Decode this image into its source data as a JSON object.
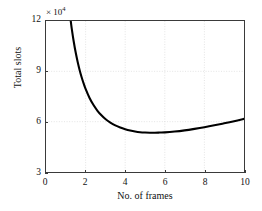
{
  "chart_data": {
    "type": "line",
    "title": "",
    "xlabel": "No. of frames",
    "ylabel": "Total slots",
    "y_multiplier_text": "× 10",
    "y_multiplier_exponent": "4",
    "xlim": [
      0,
      10
    ],
    "ylim": [
      3,
      12
    ],
    "xticks": [
      0,
      2,
      4,
      6,
      8,
      10
    ],
    "xtick_labels": [
      "0",
      "2",
      "4",
      "6",
      "8",
      "10"
    ],
    "yticks": [
      3,
      6,
      9,
      12
    ],
    "ytick_labels": [
      "3",
      "6",
      "9",
      "12"
    ],
    "grid": true,
    "legend": false,
    "curve_color": "#000000",
    "axis_color": "#3a3a3a",
    "grid_color": "#d8d8d8",
    "series": [
      {
        "name": "total slots",
        "x": [
          1.25,
          1.3,
          1.4,
          1.5,
          1.6,
          1.7,
          1.8,
          1.9,
          2.0,
          2.2,
          2.4,
          2.6,
          2.8,
          3.0,
          3.25,
          3.5,
          3.75,
          4.0,
          4.25,
          4.5,
          4.75,
          5.0,
          5.25,
          5.5,
          5.75,
          6.0,
          6.5,
          7.0,
          7.5,
          8.0,
          8.5,
          9.0,
          9.5,
          10.0
        ],
        "y": [
          12.0,
          11.55,
          10.78,
          10.12,
          9.56,
          9.07,
          8.65,
          8.28,
          7.95,
          7.41,
          6.99,
          6.65,
          6.38,
          6.16,
          5.95,
          5.78,
          5.65,
          5.55,
          5.47,
          5.41,
          5.37,
          5.35,
          5.34,
          5.34,
          5.35,
          5.36,
          5.41,
          5.48,
          5.57,
          5.67,
          5.78,
          5.9,
          6.03,
          6.17
        ]
      }
    ],
    "minimum": {
      "x": 5.0,
      "y": 5.34
    }
  }
}
